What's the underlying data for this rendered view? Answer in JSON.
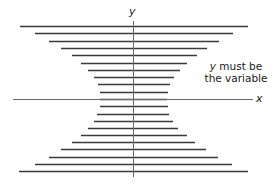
{
  "labels": {
    "y_axis": "y",
    "x_axis": "x",
    "note_var": "y",
    "note_line1_rest": " must be",
    "note_line2": "the variable"
  },
  "colors": {
    "line": "#3a3a3a",
    "axis": "#6a6a6a",
    "text": "#1a1a1a"
  },
  "axes": {
    "y_axis": {
      "x": 133,
      "y1": 21,
      "y2": 177
    },
    "x_axis": {
      "y": 99,
      "x1": 13,
      "x2": 253
    }
  },
  "horizontal_lines": [
    {
      "y": 26,
      "x1": 20,
      "x2": 248
    },
    {
      "y": 33,
      "x1": 35,
      "x2": 233
    },
    {
      "y": 41,
      "x1": 49,
      "x2": 219
    },
    {
      "y": 48,
      "x1": 61,
      "x2": 207
    },
    {
      "y": 55,
      "x1": 72,
      "x2": 197
    },
    {
      "y": 63,
      "x1": 81,
      "x2": 187
    },
    {
      "y": 70,
      "x1": 88,
      "x2": 180
    },
    {
      "y": 77,
      "x1": 94,
      "x2": 174
    },
    {
      "y": 84,
      "x1": 98,
      "x2": 170
    },
    {
      "y": 92,
      "x1": 100,
      "x2": 168
    },
    {
      "y": 99,
      "x1": 100,
      "x2": 167
    },
    {
      "y": 106,
      "x1": 100,
      "x2": 168
    },
    {
      "y": 114,
      "x1": 97,
      "x2": 169
    },
    {
      "y": 121,
      "x1": 94,
      "x2": 173
    },
    {
      "y": 128,
      "x1": 88,
      "x2": 178
    },
    {
      "y": 135,
      "x1": 81,
      "x2": 187
    },
    {
      "y": 142,
      "x1": 72,
      "x2": 195
    },
    {
      "y": 149,
      "x1": 61,
      "x2": 206
    },
    {
      "y": 157,
      "x1": 49,
      "x2": 218
    },
    {
      "y": 164,
      "x1": 35,
      "x2": 232
    },
    {
      "y": 171,
      "x1": 19,
      "x2": 248
    }
  ]
}
